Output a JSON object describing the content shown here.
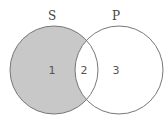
{
  "diagram": {
    "type": "venn",
    "sets": [
      {
        "label": "S",
        "shaded": true
      },
      {
        "label": "P",
        "shaded": false
      }
    ],
    "regions": [
      {
        "number": "1",
        "description": "S only",
        "shaded": true
      },
      {
        "number": "2",
        "description": "S and P",
        "shaded": false
      },
      {
        "number": "3",
        "description": "P only",
        "shaded": false
      }
    ],
    "colors": {
      "shade": "#c8c8c8",
      "stroke": "#777777",
      "background": "#ffffff"
    }
  }
}
